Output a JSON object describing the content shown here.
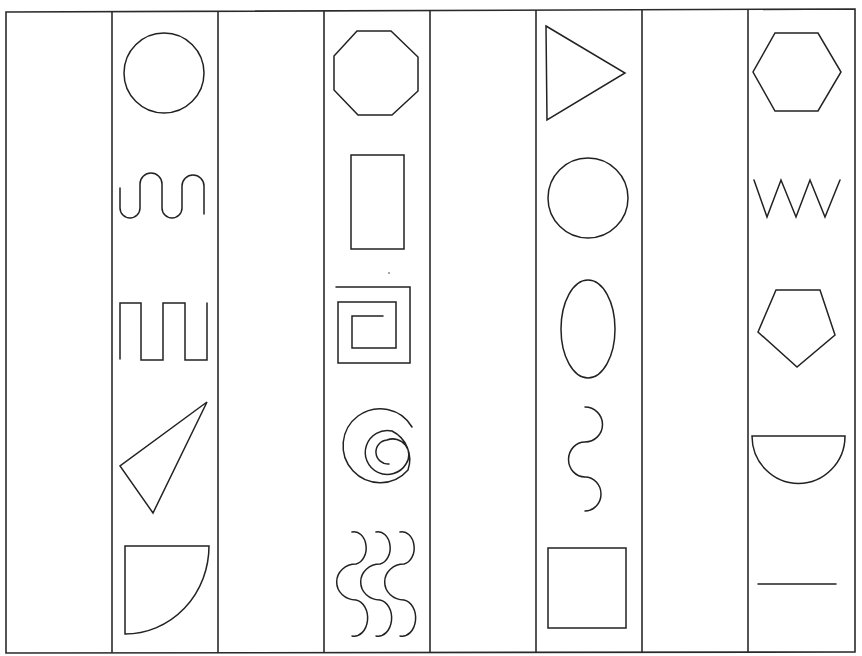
{
  "worksheet": {
    "background": "#ffffff",
    "ink_color": "#222222",
    "column_count": 8,
    "columns": [
      {
        "index": 0,
        "shapes": []
      },
      {
        "index": 1,
        "shapes": [
          "circle",
          "meander-wave",
          "square-wave",
          "scalene-triangle",
          "quarter-circle"
        ]
      },
      {
        "index": 2,
        "shapes": []
      },
      {
        "index": 3,
        "shapes": [
          "octagon",
          "rectangle",
          "square-spiral",
          "round-spiral",
          "triple-wave"
        ]
      },
      {
        "index": 4,
        "shapes": []
      },
      {
        "index": 5,
        "shapes": [
          "right-pointing-triangle",
          "circle",
          "oval",
          "s-curve",
          "square"
        ]
      },
      {
        "index": 6,
        "shapes": []
      },
      {
        "index": 7,
        "shapes": [
          "hexagon",
          "zigzag",
          "pentagon",
          "semicircle",
          "horizontal-line"
        ]
      }
    ]
  }
}
